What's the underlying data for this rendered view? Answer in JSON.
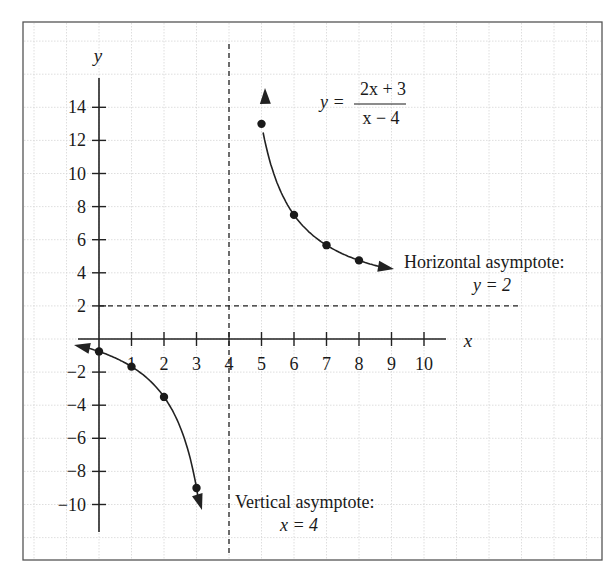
{
  "chart_data": {
    "type": "line",
    "title": "",
    "function_label": {
      "lhs": "y =",
      "numerator": "2x + 3",
      "denominator": "x − 4"
    },
    "xlabel": "x",
    "ylabel": "y",
    "xlim": [
      -0.8,
      11
    ],
    "ylim": [
      -12,
      17
    ],
    "grid": true,
    "x_ticks": [
      1,
      2,
      3,
      4,
      5,
      6,
      7,
      8,
      9,
      10
    ],
    "x_tick_labels": [
      "1",
      "2",
      "3",
      "4",
      "5",
      "6",
      "7",
      "8",
      "9",
      "10"
    ],
    "y_ticks": [
      14,
      12,
      10,
      8,
      6,
      4,
      2,
      -2,
      -4,
      -6,
      -8,
      -10
    ],
    "y_tick_labels": [
      "14",
      "12",
      "10",
      "8",
      "6",
      "4",
      "2",
      "−2",
      "−4",
      "−6",
      "−8",
      "−10"
    ],
    "series": [
      {
        "name": "left branch",
        "points": [
          [
            0,
            -0.75
          ],
          [
            1,
            -1.67
          ],
          [
            2,
            -3.5
          ],
          [
            3,
            -9
          ]
        ]
      },
      {
        "name": "right branch",
        "points": [
          [
            5,
            13
          ],
          [
            6,
            7.5
          ],
          [
            7,
            5.67
          ],
          [
            8,
            4.75
          ]
        ]
      }
    ],
    "asymptotes": {
      "horizontal": {
        "value": 2,
        "label_line1": "Horizontal asymptote:",
        "label_line2": "y = 2"
      },
      "vertical": {
        "value": 4,
        "label_line1": "Vertical asymptote:",
        "label_line2": "x = 4"
      }
    }
  }
}
